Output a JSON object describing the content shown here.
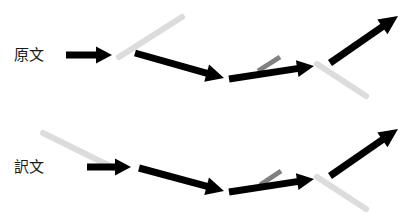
{
  "canvas": {
    "width": 416,
    "height": 215,
    "background": "#ffffff"
  },
  "colors": {
    "arrow_black": "#000000",
    "line_light_gray": "#dcdcdc",
    "line_mid_gray": "#808080",
    "label_text": "#1a1a1a"
  },
  "rows": [
    {
      "id": "source-text-row",
      "label": "原文",
      "label_x": 14,
      "label_y": 55,
      "segments": [
        {
          "name": "arrow-1",
          "kind": "arrow",
          "color_role": "arrow_black",
          "width": 7,
          "x1": 66,
          "y1": 55,
          "x2": 112,
          "y2": 55,
          "head_length": 16,
          "head_width": 17
        },
        {
          "name": "guide-line-1",
          "kind": "line",
          "color_role": "line_light_gray",
          "width": 6,
          "x1": 119,
          "y1": 57,
          "x2": 182,
          "y2": 17
        },
        {
          "name": "arrow-2",
          "kind": "arrow",
          "color_role": "arrow_black",
          "width": 7,
          "x1": 135,
          "y1": 53,
          "x2": 224,
          "y2": 78,
          "head_length": 18,
          "head_width": 18
        },
        {
          "name": "guide-line-2",
          "kind": "line",
          "color_role": "line_mid_gray",
          "width": 5,
          "x1": 258,
          "y1": 71,
          "x2": 280,
          "y2": 57
        },
        {
          "name": "arrow-3",
          "kind": "arrow",
          "color_role": "arrow_black",
          "width": 7,
          "x1": 229,
          "y1": 79,
          "x2": 314,
          "y2": 66,
          "head_length": 17,
          "head_width": 17
        },
        {
          "name": "guide-line-3",
          "kind": "line",
          "color_role": "line_light_gray",
          "width": 6,
          "x1": 317,
          "y1": 64,
          "x2": 366,
          "y2": 96
        },
        {
          "name": "arrow-4",
          "kind": "arrow",
          "color_role": "arrow_black",
          "width": 7,
          "x1": 330,
          "y1": 63,
          "x2": 398,
          "y2": 16,
          "head_length": 19,
          "head_width": 18
        }
      ]
    },
    {
      "id": "translated-text-row",
      "label": "訳文",
      "label_x": 14,
      "label_y": 167,
      "segments": [
        {
          "name": "guide-line-1",
          "kind": "line",
          "color_role": "line_light_gray",
          "width": 6,
          "x1": 43,
          "y1": 133,
          "x2": 116,
          "y2": 169
        },
        {
          "name": "arrow-1",
          "kind": "arrow",
          "color_role": "arrow_black",
          "width": 7,
          "x1": 87,
          "y1": 167,
          "x2": 131,
          "y2": 167,
          "head_length": 16,
          "head_width": 17
        },
        {
          "name": "arrow-2",
          "kind": "arrow",
          "color_role": "arrow_black",
          "width": 7,
          "x1": 139,
          "y1": 168,
          "x2": 224,
          "y2": 191,
          "head_length": 18,
          "head_width": 18
        },
        {
          "name": "guide-line-2",
          "kind": "line",
          "color_role": "line_mid_gray",
          "width": 5,
          "x1": 260,
          "y1": 185,
          "x2": 281,
          "y2": 171
        },
        {
          "name": "arrow-3",
          "kind": "arrow",
          "color_role": "arrow_black",
          "width": 7,
          "x1": 229,
          "y1": 192,
          "x2": 314,
          "y2": 179,
          "head_length": 17,
          "head_width": 17
        },
        {
          "name": "guide-line-3",
          "kind": "line",
          "color_role": "line_light_gray",
          "width": 6,
          "x1": 317,
          "y1": 177,
          "x2": 366,
          "y2": 209
        },
        {
          "name": "arrow-4",
          "kind": "arrow",
          "color_role": "arrow_black",
          "width": 7,
          "x1": 330,
          "y1": 176,
          "x2": 398,
          "y2": 129,
          "head_length": 19,
          "head_width": 18
        }
      ]
    }
  ]
}
